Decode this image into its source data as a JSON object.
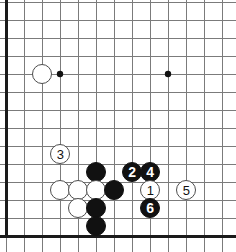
{
  "diagram": {
    "board": {
      "width": 236,
      "height": 252,
      "origin_x": 6,
      "origin_y": 2,
      "spacing": 18,
      "cols": 13,
      "rows": 14,
      "line_color": "#7b7b7b",
      "edge_color": "#1a1a1a",
      "background_color": "#ffffff",
      "left_edge_is_board_border": true
    },
    "star_points": [
      {
        "name": "star-point-upper-left",
        "x": 60,
        "y": 74
      },
      {
        "name": "star-point-upper-right",
        "x": 168,
        "y": 74
      }
    ],
    "stones": [
      {
        "name": "white-stone-upper-left",
        "color": "white",
        "x": 42,
        "y": 74,
        "label": ""
      },
      {
        "name": "white-stone-move-3",
        "color": "white",
        "x": 60,
        "y": 154,
        "label": "3"
      },
      {
        "name": "black-stone-center-top",
        "color": "black",
        "x": 96,
        "y": 172,
        "label": ""
      },
      {
        "name": "white-stone-left-a",
        "color": "white",
        "x": 60,
        "y": 190,
        "label": ""
      },
      {
        "name": "white-stone-left-b",
        "color": "white",
        "x": 78,
        "y": 190,
        "label": ""
      },
      {
        "name": "white-stone-left-c",
        "color": "white",
        "x": 96,
        "y": 190,
        "label": ""
      },
      {
        "name": "black-stone-center-right",
        "color": "black",
        "x": 114,
        "y": 190,
        "label": ""
      },
      {
        "name": "white-stone-below",
        "color": "white",
        "x": 78,
        "y": 208,
        "label": ""
      },
      {
        "name": "black-stone-lower-a",
        "color": "black",
        "x": 96,
        "y": 208,
        "label": ""
      },
      {
        "name": "black-stone-lower-b",
        "color": "black",
        "x": 96,
        "y": 226,
        "label": ""
      },
      {
        "name": "black-stone-move-2",
        "color": "black",
        "x": 132,
        "y": 172,
        "label": "2"
      },
      {
        "name": "black-stone-move-4",
        "color": "black",
        "x": 150,
        "y": 172,
        "label": "4"
      },
      {
        "name": "white-stone-move-1",
        "color": "white",
        "x": 150,
        "y": 190,
        "label": "1"
      },
      {
        "name": "white-stone-move-5",
        "color": "white",
        "x": 186,
        "y": 190,
        "label": "5"
      },
      {
        "name": "black-stone-move-6",
        "color": "black",
        "x": 150,
        "y": 208,
        "label": "6"
      }
    ],
    "stone_radius": 10,
    "star_radius": 3.2,
    "move_sequence": [
      "1",
      "2",
      "3",
      "4",
      "5",
      "6"
    ]
  }
}
